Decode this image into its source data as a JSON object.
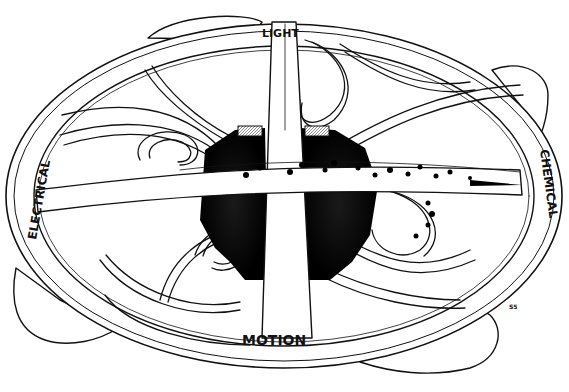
{
  "figure": {
    "labels": {
      "top": "LIGHT",
      "left": "ELECTRICAL",
      "right": "CHEMICAL",
      "bottom": "MOTION"
    },
    "signature": "S5",
    "colors": {
      "ink": "#111111",
      "paper": "#ffffff",
      "core": "#0a0a0a",
      "hatch": "#9a9a9a"
    }
  }
}
